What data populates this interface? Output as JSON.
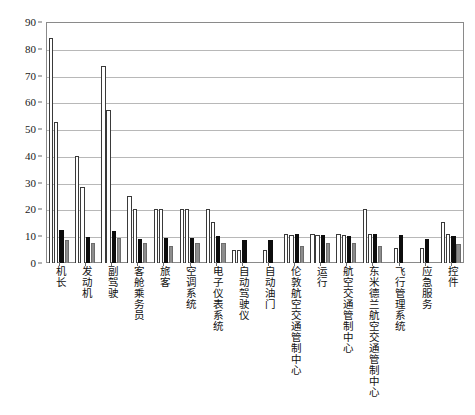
{
  "chart_data": {
    "type": "bar",
    "title": "",
    "subtitle": "",
    "xlabel": "",
    "ylabel": "",
    "ylim": [
      0,
      90
    ],
    "yticks": [
      0,
      10,
      20,
      30,
      40,
      50,
      60,
      70,
      80,
      90
    ],
    "ytick_labels": [
      "0",
      "10",
      "20",
      "30",
      "40",
      "50",
      "60",
      "70",
      "80",
      "90"
    ],
    "grid": true,
    "legend": false,
    "legend_position": "none",
    "bar_group_count": 16,
    "series_count": 4,
    "categories": [
      "机长",
      "发动机",
      "副驾驶",
      "客舱乘务员",
      "旅客",
      "空调系统",
      "电子仪表系统",
      "自动驾驶仪",
      "自动油门",
      "伦敦航空交通管制中心",
      "运行",
      "航空交通管制中心",
      "东米德兰航空交通管制中心",
      "飞行管理系统",
      "应急服务",
      "控件"
    ],
    "series": [
      {
        "name": "series-1",
        "color": "#ffffff",
        "values": [
          84,
          40,
          73.5,
          25,
          20,
          20,
          20,
          5,
          0,
          11,
          11,
          11,
          20,
          0,
          0,
          15.5
        ]
      },
      {
        "name": "series-2",
        "color": "#ffffff",
        "values": [
          52.5,
          28.5,
          57,
          20,
          20,
          20,
          15.5,
          5,
          5,
          10.5,
          10.5,
          10.5,
          11,
          5.5,
          5.5,
          11
        ]
      },
      {
        "name": "series-3",
        "color": "#0d0d0d",
        "values": [
          12.5,
          9.8,
          11.8,
          9,
          9.5,
          9.5,
          10,
          8.5,
          8.5,
          11,
          10.5,
          10,
          11,
          10.5,
          9,
          10
        ]
      },
      {
        "name": "series-4",
        "color": "#8d8d8d",
        "values": [
          8.7,
          7.5,
          9.3,
          7.5,
          6.5,
          7.5,
          7.5,
          0,
          0,
          6.5,
          7.5,
          7.5,
          6.5,
          0,
          0,
          7
        ]
      }
    ]
  }
}
